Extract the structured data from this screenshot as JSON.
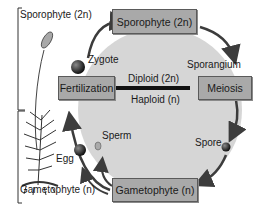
{
  "diagram": {
    "bracket_labels": {
      "sporophyte": "Sporophyte (2n)",
      "gametophyte": "Gametophyte (n)"
    },
    "boxes": {
      "sporophyte": "Sporophyte (2n)",
      "meiosis": "Meiosis",
      "gametophyte": "Gametophyte (n)",
      "fertilization": "Fertilization"
    },
    "labels": {
      "zygote": "Zygote",
      "sporangium": "Sporangium",
      "spore": "Spore",
      "sperm": "Sperm",
      "egg": "Egg",
      "diploid": "Diploid (2n)",
      "haploid": "Haploid (n)"
    },
    "colors": {
      "circle_fill": "#d4d4d4",
      "box_fill": "#a9a9a9",
      "arrow": "#4a4a4a",
      "divider": "#111111"
    }
  }
}
